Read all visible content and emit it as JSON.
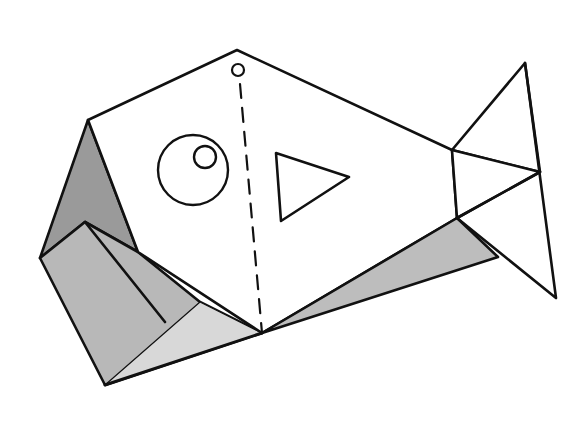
{
  "figure": {
    "title": "Origami fish diagram",
    "colors": {
      "line": "#111111",
      "paper": "#ffffff",
      "shade_dark": "#9a9a9a",
      "shade_mid": "#b8b8b8",
      "shade_light": "#d8d8d8"
    },
    "parts": [
      "body",
      "hanging-hole",
      "fold-line",
      "eye",
      "pupil",
      "fin",
      "mouth-flaps",
      "tail",
      "belly-fold"
    ]
  }
}
